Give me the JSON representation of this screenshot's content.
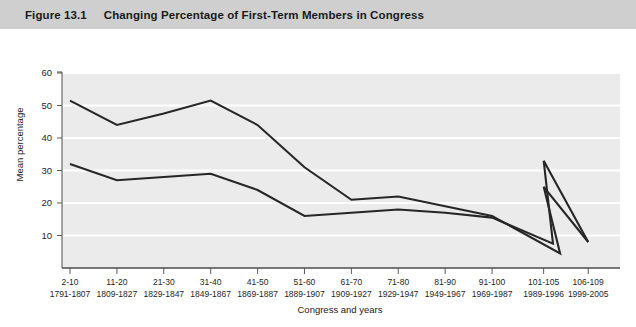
{
  "title_bar": {
    "figure_number": "Figure 13.1",
    "figure_title": "Changing Percentage of First-Term Members in Congress"
  },
  "legend": {
    "position": "top-left",
    "items": [
      {
        "label": "House",
        "color": "#262626",
        "icon": "line-swatch-icon"
      },
      {
        "label": "Senate",
        "color": "#262626",
        "icon": "line-swatch-icon"
      }
    ]
  },
  "chart_data": {
    "type": "line",
    "title": "Changing Percentage of First-Term Members in Congress",
    "xlabel": "Congress and years",
    "ylabel": "Mean percentage",
    "ylim": [
      0,
      60
    ],
    "yticks": [
      10,
      20,
      30,
      40,
      50,
      60
    ],
    "ytick_labels": [
      "10",
      "20",
      "30",
      "40",
      "50",
      "60"
    ],
    "grid": "horizontal",
    "plot_background": "#ebebeb",
    "categories": [
      "2-10",
      "11-20",
      "21-30",
      "31-40",
      "41-50",
      "51-60",
      "61-70",
      "71-80",
      "81-90",
      "91-100",
      "101-105",
      "106-109"
    ],
    "category_years": [
      "1791-1807",
      "1809-1827",
      "1829-1847",
      "1849-1867",
      "1869-1887",
      "1889-1907",
      "1909-1927",
      "1929-1947",
      "1949-1967",
      "1969-1987",
      "1989-1996",
      "1999-2005"
    ],
    "series": [
      {
        "name": "House",
        "color": "#262626",
        "values": [
          51.5,
          44,
          47.5,
          51.5,
          44,
          31,
          21,
          22,
          19,
          16,
          25,
          8
        ]
      },
      {
        "name": "Senate",
        "color": "#262626",
        "values": [
          32,
          27,
          28,
          29,
          24,
          16,
          17,
          18,
          17,
          15.5,
          33,
          8
        ]
      }
    ],
    "extra_vertices": {
      "note": "both series dip sharply between 91-100 and 101-105 before spiking",
      "House": [
        {
          "x_fraction": 10.45,
          "value": 4.5
        }
      ],
      "Senate": [
        {
          "x_fraction": 10.3,
          "value": 7.5
        }
      ]
    }
  }
}
